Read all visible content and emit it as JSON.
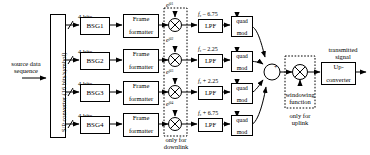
{
  "figure": {
    "type": "block-diagram"
  },
  "input": {
    "label_line1": "source data",
    "label_line2": "sequence"
  },
  "sp_converter": {
    "label": "S/P converter (16 bits/symbol)"
  },
  "branches": [
    {
      "bits_label": "4 bits",
      "bsg_label": "BSG1",
      "formatter_line1": "Frame",
      "formatter_line2": "formatter",
      "phase_label_base": "e",
      "phase_label_exp": "jθ1",
      "freq_carrier": "f",
      "freq_sub": "c",
      "freq_offset": "– 6.75",
      "lpf_label": "LPF",
      "mod_line1": "quad",
      "mod_line2": "mod"
    },
    {
      "bits_label": "4 bits",
      "bsg_label": "BSG2",
      "formatter_line1": "Frame",
      "formatter_line2": "formatter",
      "phase_label_base": "e",
      "phase_label_exp": "jθ2",
      "freq_carrier": "f",
      "freq_sub": "c",
      "freq_offset": "– 2.25",
      "lpf_label": "LPF",
      "mod_line1": "quad",
      "mod_line2": "mod"
    },
    {
      "bits_label": "4 bits",
      "bsg_label": "BSG3",
      "formatter_line1": "Frame",
      "formatter_line2": "formatter",
      "phase_label_base": "e",
      "phase_label_exp": "jθ3",
      "freq_carrier": "f",
      "freq_sub": "c",
      "freq_offset": "+ 2.25",
      "lpf_label": "LPF",
      "mod_line1": "quad",
      "mod_line2": "mod"
    },
    {
      "bits_label": "4 bits",
      "bsg_label": "BSG4",
      "formatter_line1": "Frame",
      "formatter_line2": "formatter",
      "phase_label_base": "e",
      "phase_label_exp": "jθ4",
      "freq_carrier": "f",
      "freq_sub": "c",
      "freq_offset": "+ 6.75",
      "lpf_label": "LPF",
      "mod_line1": "quad",
      "mod_line2": "mod"
    }
  ],
  "annotations": {
    "downlink_line1": "only for",
    "downlink_line2": "downlink",
    "uplink_line1": "only for",
    "uplink_line2": "uplink",
    "windowing_line1": "windowing",
    "windowing_line2": "function"
  },
  "summer": {
    "symbol": "+"
  },
  "upconverter": {
    "line1": "Up-",
    "line2": "converter"
  },
  "output": {
    "label_line1": "transmitted",
    "label_line2": "signal"
  }
}
